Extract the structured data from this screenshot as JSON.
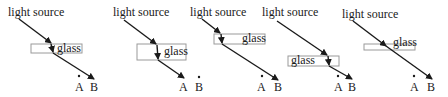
{
  "labels": {
    "source": "light source",
    "glass": "glass",
    "point_a": "A",
    "point_b": "B"
  },
  "panels": [
    {
      "id": 1,
      "source_label": "light source",
      "glass_label": "glass",
      "a_label": "A",
      "b_label": "B",
      "ray_target": "B"
    },
    {
      "id": 2,
      "source_label": "light source",
      "glass_label": "glass",
      "a_label": "A",
      "b_label": "B",
      "ray_target": "A"
    },
    {
      "id": 3,
      "source_label": "light source",
      "glass_label": "glass",
      "a_label": "A",
      "b_label": "B",
      "ray_target": "B"
    },
    {
      "id": 4,
      "source_label": "light source",
      "glass_label": "glass",
      "a_label": "A",
      "b_label": "B",
      "ray_target": "B"
    },
    {
      "id": 5,
      "source_label": "light source",
      "glass_label": "glass",
      "a_label": "A",
      "b_label": "B",
      "ray_target": "B"
    }
  ],
  "colors": {
    "ray": "#1a1a1a",
    "glass_border": "#9a9a9a",
    "background": "#ffffff"
  }
}
